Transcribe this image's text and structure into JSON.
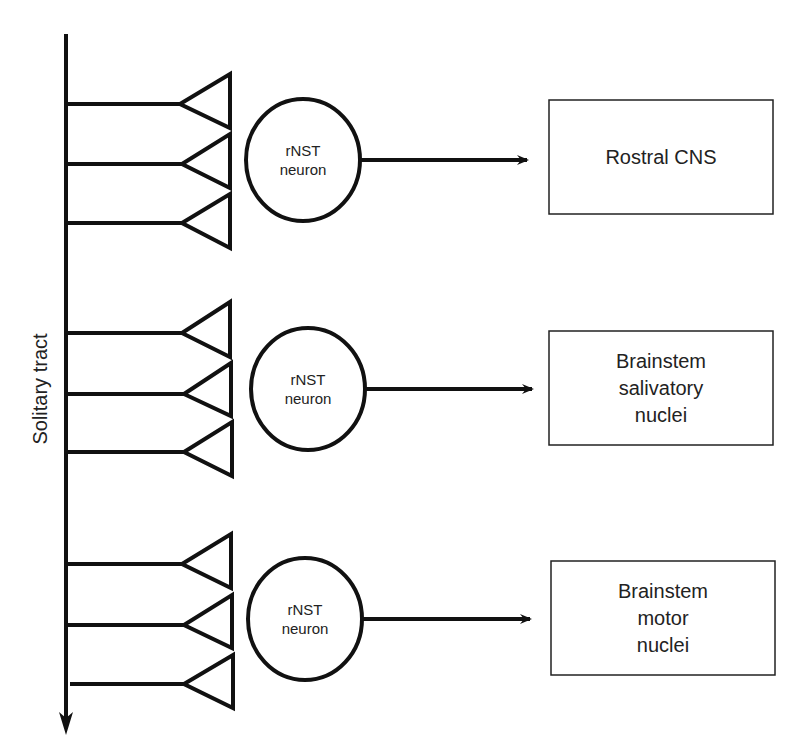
{
  "diagram": {
    "type": "neural-circuit-schematic",
    "tract": {
      "label": "Solitary tract",
      "direction": "downward"
    },
    "groups": [
      {
        "neuron_label_line1": "rNST",
        "neuron_label_line2": "neuron",
        "synapse_count": 3,
        "target": {
          "lines": [
            "Rostral CNS"
          ]
        }
      },
      {
        "neuron_label_line1": "rNST",
        "neuron_label_line2": "neuron",
        "synapse_count": 3,
        "target": {
          "lines": [
            "Brainstem",
            "salivatory",
            "nuclei"
          ]
        }
      },
      {
        "neuron_label_line1": "rNST",
        "neuron_label_line2": "neuron",
        "synapse_count": 3,
        "target": {
          "lines": [
            "Brainstem",
            "motor",
            "nuclei"
          ]
        }
      }
    ],
    "colors": {
      "stroke": "#111111",
      "background": "#ffffff",
      "text": "#222222"
    }
  }
}
